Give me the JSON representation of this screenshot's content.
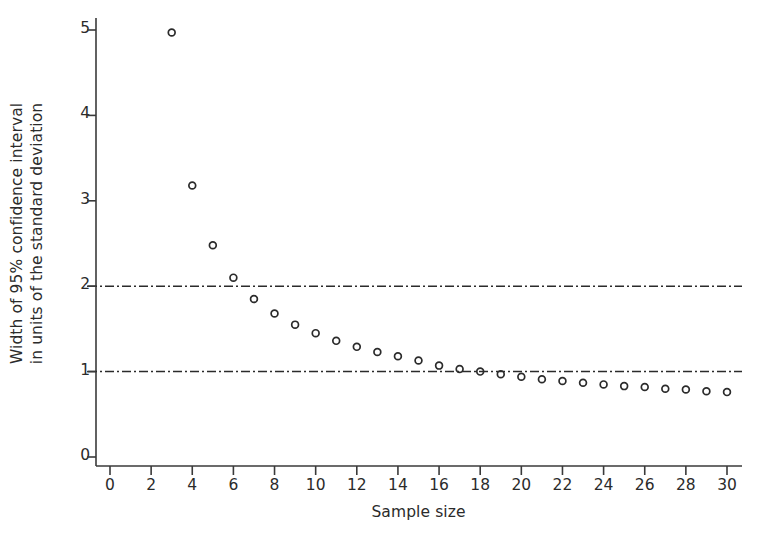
{
  "chart_data": {
    "type": "scatter",
    "title": "",
    "subtitle": "",
    "xlabel": "Sample size",
    "ylabel": "Width of 95% confidence interval in units of the standard deviation",
    "ylabel_lines": [
      "Width of 95% confidence interval",
      "in units of the standard deviation"
    ],
    "xlim": [
      0,
      30
    ],
    "ylim": [
      0,
      5
    ],
    "xticks": [
      0,
      2,
      4,
      6,
      8,
      10,
      12,
      14,
      16,
      18,
      20,
      22,
      24,
      26,
      28,
      30
    ],
    "xtick_labels": [
      "0",
      "2",
      "4",
      "6",
      "8",
      "10",
      "12",
      "14",
      "16",
      "18",
      "20",
      "22",
      "24",
      "26",
      "28",
      "30"
    ],
    "yticks": [
      0,
      1,
      2,
      3,
      4,
      5
    ],
    "ytick_labels": [
      "0",
      "1",
      "2",
      "3",
      "4",
      "5"
    ],
    "grid": false,
    "legend": "none",
    "marker": "open-circle",
    "marker_color": "#2b2b2b",
    "marker_fill": "none",
    "axis_color": "#3a3a3a",
    "x": [
      3,
      4,
      5,
      6,
      7,
      8,
      9,
      10,
      11,
      12,
      13,
      14,
      15,
      16,
      17,
      18,
      19,
      20,
      21,
      22,
      23,
      24,
      25,
      26,
      27,
      28,
      29,
      30
    ],
    "values": [
      4.97,
      3.18,
      2.48,
      2.1,
      1.85,
      1.68,
      1.55,
      1.45,
      1.36,
      1.29,
      1.23,
      1.18,
      1.13,
      1.07,
      1.03,
      1.0,
      0.97,
      0.94,
      0.91,
      0.89,
      0.87,
      0.85,
      0.83,
      0.82,
      0.8,
      0.79,
      0.77,
      0.76
    ],
    "series": [
      {
        "name": "Width of 95% confidence interval",
        "x": [
          3,
          4,
          5,
          6,
          7,
          8,
          9,
          10,
          11,
          12,
          13,
          14,
          15,
          16,
          17,
          18,
          19,
          20,
          21,
          22,
          23,
          24,
          25,
          26,
          27,
          28,
          29,
          30
        ],
        "values": [
          4.97,
          3.18,
          2.48,
          2.1,
          1.85,
          1.68,
          1.55,
          1.45,
          1.36,
          1.29,
          1.23,
          1.18,
          1.13,
          1.07,
          1.03,
          1.0,
          0.97,
          0.94,
          0.91,
          0.89,
          0.87,
          0.85,
          0.83,
          0.82,
          0.8,
          0.79,
          0.77,
          0.76
        ]
      }
    ],
    "reference_lines": [
      {
        "name": "reference-line-2",
        "axis": "y",
        "value": 2,
        "style": "dash-dot",
        "color": "#2b2b2b"
      },
      {
        "name": "reference-line-1",
        "axis": "y",
        "value": 1,
        "style": "dash-dot",
        "color": "#2b2b2b"
      }
    ],
    "annotations": []
  }
}
